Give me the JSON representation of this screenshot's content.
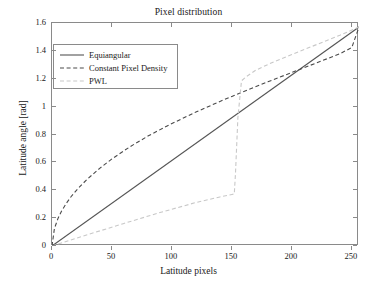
{
  "chart_data": {
    "type": "line",
    "title": "Pixel distribution",
    "xlabel": "Latitude pixels",
    "ylabel": "Latitude angle [rad]",
    "xlim": [
      0,
      256
    ],
    "ylim": [
      0,
      1.6
    ],
    "xticks": [
      0,
      50,
      100,
      150,
      200,
      250
    ],
    "xtick_labels": [
      "0",
      "50",
      "100",
      "150",
      "200",
      "250"
    ],
    "yticks": [
      0,
      0.2,
      0.4,
      0.6,
      0.8,
      1,
      1.2,
      1.4,
      1.6
    ],
    "ytick_labels": [
      "0",
      "0.2",
      "0.4",
      "0.6",
      "0.8",
      "1",
      "1.2",
      "1.4",
      "1.6"
    ],
    "grid": false,
    "legend_position": "upper left",
    "series": [
      {
        "name": "Equiangular",
        "style": "solid",
        "color": "#555555",
        "x": [
          0,
          256
        ],
        "y": [
          0,
          1.5708
        ]
      },
      {
        "name": "Constant Pixel Density",
        "style": "dashed",
        "color": "#4a4a4a",
        "x": [
          0,
          2,
          5,
          8,
          12,
          16,
          20,
          25,
          30,
          40,
          50,
          65,
          80,
          100,
          120,
          140,
          150,
          160,
          180,
          200,
          220,
          240,
          250,
          256
        ],
        "y": [
          0,
          0.125,
          0.198,
          0.251,
          0.307,
          0.355,
          0.396,
          0.442,
          0.484,
          0.559,
          0.625,
          0.712,
          0.789,
          0.879,
          0.961,
          1.037,
          1.073,
          1.109,
          1.178,
          1.245,
          1.312,
          1.379,
          1.424,
          1.5708
        ]
      },
      {
        "name": "PWL",
        "style": "dashed",
        "color": "#c8c8c8",
        "x": [
          0,
          10,
          30,
          60,
          90,
          120,
          140,
          150,
          152,
          153,
          155,
          158,
          162,
          170,
          185,
          200,
          220,
          240,
          256
        ],
        "y": [
          0,
          0.028,
          0.082,
          0.162,
          0.24,
          0.312,
          0.352,
          0.37,
          0.373,
          0.52,
          0.92,
          1.185,
          1.215,
          1.262,
          1.322,
          1.374,
          1.443,
          1.512,
          1.5708
        ]
      }
    ]
  }
}
